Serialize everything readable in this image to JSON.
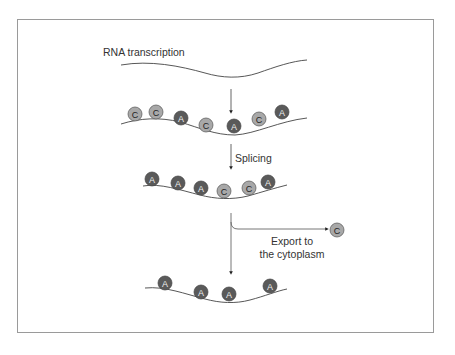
{
  "diagram": {
    "title": "RNA transcription",
    "steps": [
      {
        "label": "RNA transcription"
      },
      {
        "label": "Splicing"
      },
      {
        "label_line1": "Export to",
        "label_line2": "the cytoplasm"
      }
    ],
    "rows": [
      {
        "name": "unspliced",
        "beads": [
          "C",
          "C",
          "A",
          "C",
          "A",
          "C",
          "A"
        ]
      },
      {
        "name": "spliced",
        "beads": [
          "A",
          "A",
          "A",
          "C",
          "C",
          "A"
        ]
      },
      {
        "name": "exported",
        "beads": [
          "C"
        ]
      },
      {
        "name": "retained",
        "beads": [
          "A",
          "A",
          "A",
          "A"
        ]
      }
    ],
    "colors": {
      "A_fill": "#5a5a5a",
      "A_text": "#e8e8e8",
      "C_fill": "#a8a8a8",
      "C_text": "#2a2a2a",
      "line": "#444444",
      "frame": "#9a9a9a"
    }
  },
  "labels": {
    "rna_transcription": "RNA transcription",
    "splicing": "Splicing",
    "export_line1": "Export to",
    "export_line2": "the cytoplasm"
  },
  "beads": {
    "r1": [
      "C",
      "C",
      "A",
      "C",
      "A",
      "C",
      "A"
    ],
    "r2": [
      "A",
      "A",
      "A",
      "C",
      "C",
      "A"
    ],
    "exp": [
      "C"
    ],
    "r3": [
      "A",
      "A",
      "A",
      "A"
    ]
  }
}
